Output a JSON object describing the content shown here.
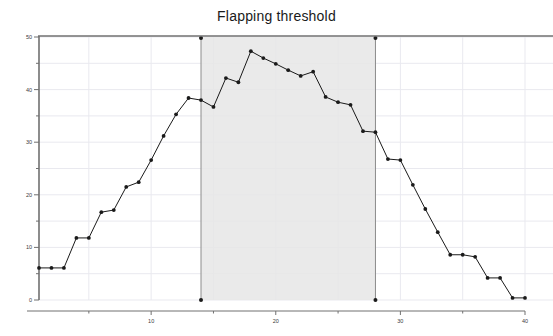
{
  "chart_data": {
    "type": "line",
    "title": "Flapping threshold",
    "xlabel": "",
    "ylabel": "",
    "xlim": [
      1,
      40
    ],
    "ylim": [
      0,
      50
    ],
    "grid": true,
    "legend": "none",
    "x_ticks": [
      10,
      20,
      30,
      40
    ],
    "x_tick_labels": [
      "10",
      "20",
      "30",
      "40"
    ],
    "y_ticks": [
      0,
      10,
      20,
      30,
      40,
      50
    ],
    "y_tick_labels": [
      "0",
      "10",
      "20",
      "30",
      "40",
      "50"
    ],
    "y_minor_ticks": [
      5,
      15,
      25,
      35,
      45
    ],
    "series": [
      {
        "name": "flapping-threshold",
        "marker": "dot",
        "color": "#1a1a1a",
        "x": [
          1,
          2,
          3,
          4,
          5,
          6,
          7,
          8,
          9,
          10,
          11,
          12,
          13,
          14,
          15,
          16,
          17,
          18,
          19,
          20,
          21,
          22,
          23,
          24,
          25,
          26,
          27,
          28,
          29,
          30,
          31,
          32,
          33,
          34,
          35,
          36,
          37,
          38,
          39,
          40
        ],
        "y": [
          6.1,
          6.1,
          6.1,
          11.8,
          11.8,
          16.7,
          17.1,
          21.5,
          22.4,
          26.6,
          31.2,
          35.3,
          38.4,
          38.0,
          36.7,
          42.2,
          41.4,
          47.3,
          46.0,
          44.9,
          43.7,
          42.6,
          43.4,
          38.6,
          37.6,
          37.1,
          32.1,
          31.9,
          26.8,
          26.6,
          21.9,
          17.3,
          12.9,
          8.6,
          8.6,
          8.2,
          4.2,
          4.2,
          0.4,
          0.4
        ]
      }
    ],
    "shaded_region": {
      "x_start": 14,
      "x_end": 28,
      "fill": "#e6e6e6",
      "border_color": "#8c8c8c",
      "endpoint_marker_color": "#1a1a1a",
      "top_value": 50,
      "bottom_value": 0
    },
    "colors": {
      "line": "#1a1a1a",
      "axis": "#707070",
      "grid": "#e9e9ef",
      "background": "#ffffff",
      "title": "#1a1a1a"
    }
  }
}
